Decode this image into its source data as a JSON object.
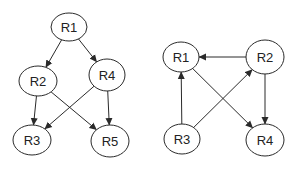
{
  "diagrams": [
    {
      "id": "left-graph",
      "nodes": [
        {
          "id": "R1",
          "label": "R1",
          "cx": 69,
          "cy": 27,
          "rx": 18,
          "ry": 14
        },
        {
          "id": "R2",
          "label": "R2",
          "cx": 38,
          "cy": 81,
          "rx": 19,
          "ry": 15
        },
        {
          "id": "R4",
          "label": "R4",
          "cx": 107,
          "cy": 75,
          "rx": 18,
          "ry": 16
        },
        {
          "id": "R3",
          "label": "R3",
          "cx": 32,
          "cy": 140,
          "rx": 19,
          "ry": 15
        },
        {
          "id": "R5",
          "label": "R5",
          "cx": 110,
          "cy": 141,
          "rx": 19,
          "ry": 16
        }
      ],
      "edges": [
        {
          "from": "R1",
          "to": "R2"
        },
        {
          "from": "R1",
          "to": "R4"
        },
        {
          "from": "R2",
          "to": "R3"
        },
        {
          "from": "R2",
          "to": "R5"
        },
        {
          "from": "R4",
          "to": "R3"
        },
        {
          "from": "R4",
          "to": "R5"
        }
      ]
    },
    {
      "id": "right-graph",
      "nodes": [
        {
          "id": "R1",
          "label": "R1",
          "cx": 181,
          "cy": 57,
          "rx": 18,
          "ry": 15
        },
        {
          "id": "R2",
          "label": "R2",
          "cx": 265,
          "cy": 57,
          "rx": 19,
          "ry": 17
        },
        {
          "id": "R3",
          "label": "R3",
          "cx": 182,
          "cy": 139,
          "rx": 18,
          "ry": 15
        },
        {
          "id": "R4",
          "label": "R4",
          "cx": 265,
          "cy": 140,
          "rx": 19,
          "ry": 16
        }
      ],
      "edges": [
        {
          "from": "R2",
          "to": "R1"
        },
        {
          "from": "R1",
          "to": "R4"
        },
        {
          "from": "R2",
          "to": "R4"
        },
        {
          "from": "R3",
          "to": "R1"
        },
        {
          "from": "R3",
          "to": "R2"
        }
      ]
    }
  ],
  "colors": {
    "stroke": "#2a2a2a",
    "node_fill": "#ffffff",
    "text": "#222222",
    "background": "#ffffff"
  }
}
